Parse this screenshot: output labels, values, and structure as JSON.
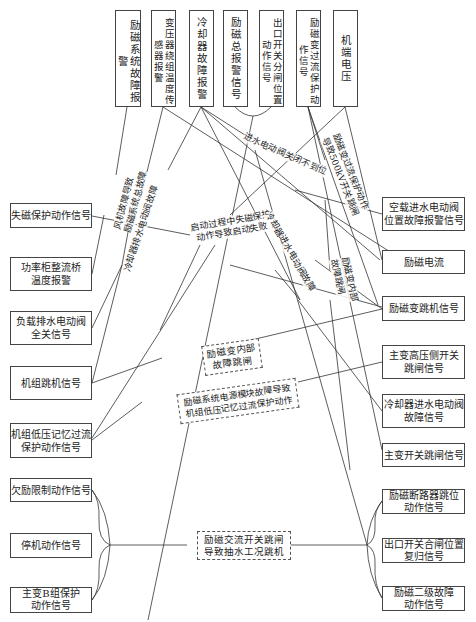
{
  "diagram": {
    "top_nodes": [
      {
        "id": "t1",
        "label": "励磁系统故障报警"
      },
      {
        "id": "t2",
        "label": "变压器绕组温度传感器报警"
      },
      {
        "id": "t3",
        "label": "冷却器故障报警"
      },
      {
        "id": "t4",
        "label": "励磁总报警信号"
      },
      {
        "id": "t5",
        "label": "出口开关分闸位置动作信号"
      },
      {
        "id": "t6",
        "label": "励磁变过流保护动作信号"
      },
      {
        "id": "t7",
        "label": "机端电压"
      }
    ],
    "left_nodes": [
      {
        "id": "l1",
        "label": "失磁保护动作信号"
      },
      {
        "id": "l2",
        "label": "功率柜整流桥温度报警"
      },
      {
        "id": "l3",
        "label": "负载排水电动阀全关信号"
      },
      {
        "id": "l4",
        "label": "机组跳机信号"
      },
      {
        "id": "l5",
        "label": "机组低压记忆过流保护动作信号"
      },
      {
        "id": "l6",
        "label": "欠励限制动作信号"
      },
      {
        "id": "l7",
        "label": "停机动作信号"
      },
      {
        "id": "l8",
        "label": "主变B组保护动作信号"
      }
    ],
    "right_nodes": [
      {
        "id": "r1",
        "label": "空载进水电动阀位置故障报警信号"
      },
      {
        "id": "r2",
        "label": "励磁电流"
      },
      {
        "id": "r3",
        "label": "励磁变跳机信号"
      },
      {
        "id": "r4",
        "label": "主变高压侧开关跳闸信号"
      },
      {
        "id": "r5",
        "label": "冷却器进水电动阀故障信号"
      },
      {
        "id": "r6",
        "label": "主变开关跳闸信号"
      },
      {
        "id": "r7",
        "label": "励磁断路器跳位动作信号"
      },
      {
        "id": "r8",
        "label": "出口开关合闸位置复归信号"
      },
      {
        "id": "r9",
        "label": "励磁二级故障动作信号"
      }
    ],
    "fault_labels": [
      {
        "id": "f1",
        "label": "风机故障导致励磁系统总故障",
        "style": "rotated"
      },
      {
        "id": "f2",
        "label": "冷却器排水电动阀故障",
        "style": "rotated"
      },
      {
        "id": "f3",
        "label": "进水电动阀关闭不到位",
        "style": "rotated"
      },
      {
        "id": "f4",
        "label": "励磁变过流保护动作导致500kV开关跳闸",
        "style": "rotated"
      },
      {
        "id": "f5",
        "label": "启动过程中失磁保护动作导致启动失败",
        "style": "rotated"
      },
      {
        "id": "f6",
        "label": "冷却器进水电动阀故障",
        "style": "rotated"
      },
      {
        "id": "f7",
        "label": "励磁变内部故障跳闸",
        "style": "rotated"
      },
      {
        "id": "f8",
        "label": "励磁变内部故障跳闸",
        "style": "dashed-box"
      },
      {
        "id": "f9",
        "label": "励磁系统电源模块故障导致机组低压记忆过流保护动作",
        "style": "dashed-box"
      },
      {
        "id": "f10",
        "label": "励磁交流开关跳闸导致抽水工况跳机",
        "style": "dashed-box"
      }
    ]
  },
  "text": {
    "t1": "励磁系统故障报警",
    "t2": "变压器绕组温度传感器报警",
    "t3": "冷却器故障报警",
    "t4": "励磁总报警信号",
    "t5": "出口开关分闸位置动作信号",
    "t6": "励磁变过流保护动作信号",
    "t7": "机端电压",
    "l1": "失磁保护动作信号",
    "l2a": "功率柜整流桥",
    "l2b": "温度报警",
    "l3a": "负载排水电动阀",
    "l3b": "全关信号",
    "l4": "机组跳机信号",
    "l5a": "机组低压记忆过流",
    "l5b": "保护动作信号",
    "l6": "欠励限制动作信号",
    "l7": "停机动作信号",
    "l8a": "主变B组保护",
    "l8b": "动作信号",
    "r1a": "空载进水电动阀",
    "r1b": "位置故障报警信号",
    "r2": "励磁电流",
    "r3": "励磁变跳机信号",
    "r4a": "主变高压侧开关",
    "r4b": "跳闸信号",
    "r5a": "冷却器进水电动阀",
    "r5b": "故障信号",
    "r6": "主变开关跳闸信号",
    "r7a": "励磁断路器跳位",
    "r7b": "动作信号",
    "r8a": "出口开关合闸位置",
    "r8b": "复归信号",
    "r9a": "励磁二级故障",
    "r9b": "动作信号",
    "f1a": "风机故障导致",
    "f1b": "励磁系统总故障",
    "f2": "冷却器排水电动阀故障",
    "f3": "进水电动阀关闭不到位",
    "f4a": "励磁变过流保护动作",
    "f4b": "导致500kV开关跳闸",
    "f5a": "启动过程中失磁保护",
    "f5b": "动作导致启动失败",
    "f6": "冷却器进水电动阀故障",
    "f7a": "励磁变内部",
    "f7b": "故障跳闸",
    "f8a": "励磁变内部",
    "f8b": "故障跳闸",
    "f9a": "励磁系统电源模块故障导致",
    "f9b": "机组低压记忆过流保护动作",
    "f10a": "励磁交流开关跳闸",
    "f10b": "导致抽水工况跳机"
  },
  "colors": {
    "line": "#333333",
    "border": "#444444",
    "text": "#222222",
    "background": "#ffffff"
  }
}
